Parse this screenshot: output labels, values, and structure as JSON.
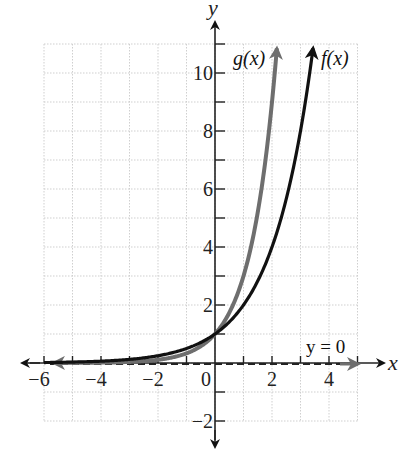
{
  "chart_data": {
    "type": "line",
    "title": "",
    "xlabel": "x",
    "ylabel": "y",
    "xlim": [
      -6,
      5
    ],
    "ylim": [
      -2,
      11
    ],
    "grid": true,
    "x_ticks": [
      -6,
      -4,
      -2,
      0,
      2,
      4
    ],
    "y_ticks": [
      -2,
      2,
      4,
      6,
      8,
      10
    ],
    "x_tick_labels": [
      "−6",
      "−4",
      "−2",
      "0",
      "2",
      "4"
    ],
    "y_tick_labels": [
      "−2",
      "2",
      "4",
      "6",
      "8",
      "10"
    ],
    "series": [
      {
        "name": "f(x)",
        "formula": "2^x",
        "color": "#111111",
        "x": [
          -6,
          -4,
          -2,
          -1,
          0,
          1,
          2,
          3,
          3.46
        ],
        "y": [
          0.016,
          0.063,
          0.25,
          0.5,
          1,
          2,
          4,
          8,
          11
        ]
      },
      {
        "name": "g(x)",
        "formula": "3^x",
        "color": "#6e6e6e",
        "x": [
          -5.5,
          -4,
          -2,
          -1,
          0,
          1,
          2,
          2.18
        ],
        "y": [
          0.002,
          0.012,
          0.111,
          0.333,
          1,
          3,
          9,
          11
        ]
      }
    ],
    "annotations": [
      {
        "text": "y = 0",
        "type": "horizontal asymptote",
        "style": "dashed",
        "y": 0
      },
      {
        "text": "g(x)",
        "anchor": "near top of g curve"
      },
      {
        "text": "f(x)",
        "anchor": "near top of f curve"
      }
    ]
  },
  "labels": {
    "x_axis": "x",
    "y_axis": "y",
    "f_label": "f(x)",
    "g_label": "g(x)",
    "asymptote": "y = 0"
  },
  "ticks": {
    "x": [
      {
        "value": -6,
        "label": "−6"
      },
      {
        "value": -4,
        "label": "−4"
      },
      {
        "value": -2,
        "label": "−2"
      },
      {
        "value": 0,
        "label": "0"
      },
      {
        "value": 2,
        "label": "2"
      },
      {
        "value": 4,
        "label": "4"
      }
    ],
    "y": [
      {
        "value": 10,
        "label": "10"
      },
      {
        "value": 8,
        "label": "8"
      },
      {
        "value": 6,
        "label": "6"
      },
      {
        "value": 4,
        "label": "4"
      },
      {
        "value": 2,
        "label": "2"
      },
      {
        "value": -2,
        "label": "−2"
      }
    ]
  },
  "colors": {
    "f_curve": "#111111",
    "g_curve": "#6e6e6e",
    "axis": "#222222",
    "grid": "#cfcfcf"
  }
}
